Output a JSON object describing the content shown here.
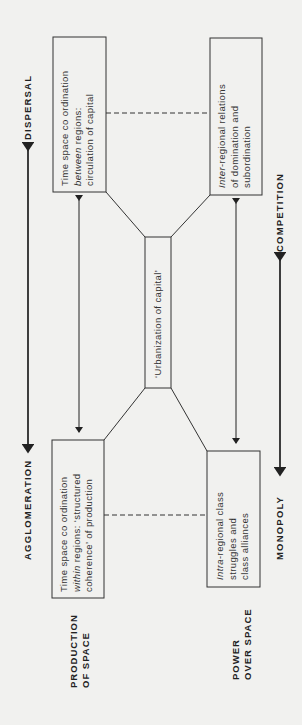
{
  "diagram": {
    "orientation": "rotated-90-ccw",
    "center": {
      "label": "‘Urbanization of capital’"
    },
    "boxes": {
      "top_left": {
        "lines": [
          "Time space co ordination",
          "between regions:",
          "circulation of capital"
        ],
        "italic_word": "between"
      },
      "top_right": {
        "lines": [
          "Inter-regional relations",
          "of domination and",
          "subordination"
        ],
        "italic_word": "Inter"
      },
      "bottom_left": {
        "lines": [
          "Time space co ordination",
          "within regions: ‘structured",
          "coherence’ of production"
        ],
        "italic_word": "within"
      },
      "bottom_right": {
        "lines": [
          "Intra-regional class",
          "struggles and",
          "class alliances"
        ],
        "italic_word": "Intra"
      }
    },
    "axes": {
      "left_top": "DISPERSAL",
      "left_bottom": "AGGLOMERATION",
      "right_top": "COMPETITION",
      "right_bottom": "MONOPOLY"
    },
    "dimensions": {
      "production": [
        "PRODUCTION",
        "OF SPACE"
      ],
      "power": [
        "POWER",
        "OVER SPACE"
      ]
    }
  }
}
